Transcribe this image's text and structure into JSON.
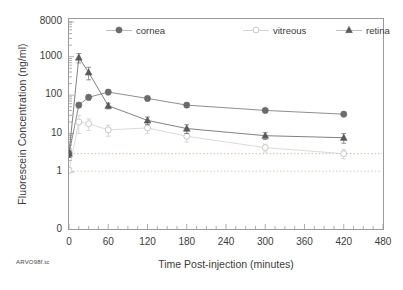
{
  "chart_data": {
    "type": "line",
    "title": "",
    "xlabel": "Time Post-injection (minutes)",
    "ylabel": "Fluorescein Concentration (ng/ml)",
    "yscale": "log",
    "xlim": [
      0,
      480
    ],
    "ylim": [
      1,
      8000
    ],
    "grid": false,
    "legend_position": "top-inside",
    "xticks": [
      "0",
      "60",
      "120",
      "180",
      "240",
      "300",
      "360",
      "420",
      "480"
    ],
    "xtick_values": [
      0,
      60,
      120,
      180,
      240,
      300,
      360,
      420,
      480
    ],
    "yticks": [
      "0",
      "1",
      "10",
      "100",
      "1000",
      "8000"
    ],
    "ytick_values": [
      0,
      1,
      10,
      100,
      1000,
      8000
    ],
    "x": [
      0,
      15,
      30,
      60,
      120,
      180,
      300,
      420
    ],
    "series": [
      {
        "name": "cornea",
        "marker": "filled-circle",
        "color": "#6b6b6b",
        "values": [
          3.0,
          55,
          88,
          120,
          82,
          55,
          40,
          32
        ],
        "errors": [
          0.6,
          8,
          14,
          18,
          11,
          7,
          5,
          4
        ]
      },
      {
        "name": "vitreous",
        "marker": "open-circle",
        "color": "#c8c8c8",
        "values": [
          1.1,
          20,
          18,
          12.5,
          14,
          8.5,
          4.3,
          3.0
        ],
        "errors": [
          0.2,
          10,
          6,
          4,
          4,
          2.5,
          1.0,
          0.8
        ]
      },
      {
        "name": "retina",
        "marker": "filled-triangle",
        "color": "#5a5a5a",
        "values": [
          3.0,
          950,
          390,
          53,
          22,
          13.5,
          8.8,
          7.8
        ],
        "errors": [
          0.6,
          260,
          140,
          9,
          5,
          3.5,
          1.8,
          2.2
        ]
      }
    ],
    "reference_lines": [
      {
        "name": "upper-detection-limit",
        "y": 3.0,
        "style": "dotted",
        "color": "#d0c0b8"
      },
      {
        "name": "lower-detection-limit",
        "y": 1.05,
        "style": "dotted",
        "color": "#d8d0c8"
      }
    ],
    "annotations": [
      {
        "name": "corner-note",
        "text": "ARVO98f.tc"
      }
    ]
  },
  "legend": {
    "items": [
      {
        "label": "cornea"
      },
      {
        "label": "vitreous"
      },
      {
        "label": "retina"
      }
    ]
  },
  "axes": {
    "x_title": "Time Post-injection (minutes)",
    "y_title": "Fluorescein Concentration (ng/ml)"
  },
  "footer": {
    "note": "ARVO98f.tc"
  }
}
